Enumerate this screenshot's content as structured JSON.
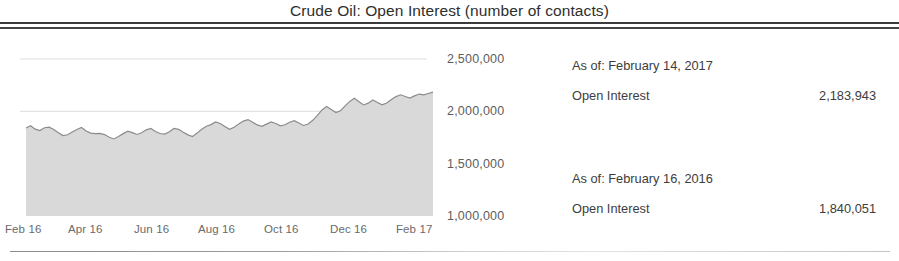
{
  "title": "Crude Oil: Open Interest (number of contacts)",
  "readout": {
    "current": {
      "as_of": "As of: February 14, 2017",
      "metric_label": "Open Interest",
      "metric_value": "2,183,943"
    },
    "prior": {
      "as_of": "As of: February 16, 2016",
      "metric_label": "Open Interest",
      "metric_value": "1,840,051"
    }
  },
  "colors": {
    "line": "#8c8c8c",
    "fill": "#d9d9d9",
    "grid": "#dcdcdc",
    "rule": "#3b3b3b",
    "text": "#3d3d3d"
  },
  "chart_data": {
    "type": "area",
    "title": "Crude Oil: Open Interest (number of contacts)",
    "xlabel": "",
    "ylabel": "",
    "ylim": [
      1000000,
      2500000
    ],
    "yticks": [
      1000000,
      1500000,
      2000000,
      2500000
    ],
    "ytick_labels": [
      "1,000,000",
      "1,500,000",
      "2,000,000",
      "2,500,000"
    ],
    "xtick_labels": [
      "Feb 16",
      "Apr 16",
      "Jun 16",
      "Aug 16",
      "Oct 16",
      "Dec 16",
      "Feb 17"
    ],
    "grid": "horizontal-only",
    "legend": "none",
    "series": [
      {
        "name": "Open Interest",
        "values": [
          1840051,
          1862000,
          1830000,
          1816000,
          1843000,
          1849000,
          1826000,
          1795000,
          1769000,
          1776000,
          1803000,
          1826000,
          1845000,
          1812000,
          1792000,
          1787000,
          1789000,
          1778000,
          1752000,
          1736000,
          1759000,
          1787000,
          1811000,
          1797000,
          1779000,
          1795000,
          1823000,
          1836000,
          1808000,
          1788000,
          1782000,
          1805000,
          1837000,
          1828000,
          1800000,
          1775000,
          1759000,
          1792000,
          1828000,
          1857000,
          1873000,
          1899000,
          1884000,
          1856000,
          1828000,
          1847000,
          1880000,
          1907000,
          1921000,
          1896000,
          1870000,
          1857000,
          1878000,
          1899000,
          1884000,
          1861000,
          1872000,
          1896000,
          1911000,
          1888000,
          1865000,
          1879000,
          1914000,
          1962000,
          2013000,
          2046000,
          2018000,
          1988000,
          2006000,
          2052000,
          2095000,
          2124000,
          2092000,
          2061000,
          2078000,
          2109000,
          2085000,
          2062000,
          2080000,
          2112000,
          2141000,
          2158000,
          2142000,
          2127000,
          2148000,
          2165000,
          2157000,
          2170000,
          2183943
        ]
      }
    ]
  }
}
